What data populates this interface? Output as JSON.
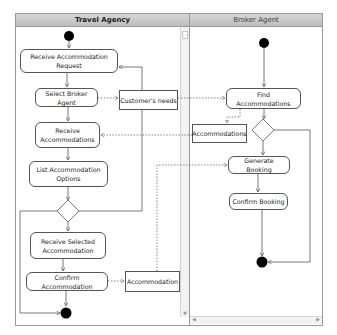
{
  "diagram": {
    "type": "UML activity diagram with swimlanes",
    "lanes": [
      {
        "id": "travel_agency",
        "label": "Travel Agency"
      },
      {
        "id": "broker_agent",
        "label": "Broker Agent"
      }
    ],
    "travel_agency": {
      "receive_request": "Receive Accommodation Request",
      "select_broker": "Select Broker Agent",
      "customers_needs": "Customer's needs",
      "receive_accommodations": "Receive Accommodations",
      "list_options": "List Accommodation Options",
      "receive_selected": "Receive Selected Accommodation",
      "confirm_accommodation": "Confirm Accommodation",
      "accommodation_object": "Accommodation"
    },
    "broker_agent": {
      "find_accommodations": "Find Accommodations",
      "accommodations_object": "Accommodations",
      "generate_booking": "Generate Booking",
      "confirm_booking": "Confirm Booking"
    },
    "colors": {
      "header_top": "#d6d6d6",
      "header_bottom": "#bdbdbd",
      "border": "#9a9a9a",
      "node_border": "#555555",
      "node_fill": "#ffffff",
      "initial_final": "#000000"
    }
  }
}
